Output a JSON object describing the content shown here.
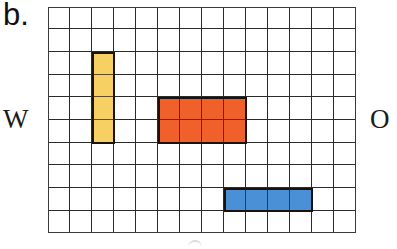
{
  "figure": {
    "panel_label": "b.",
    "labels": {
      "west": "W",
      "east": "O"
    },
    "grid": {
      "columns": 14,
      "rows": 10,
      "line_color": "#2b2b2b",
      "background": "#ffffff"
    },
    "blocks": [
      {
        "name": "yellow-block",
        "color": "#f7d063",
        "col": 2,
        "row": 2,
        "width": 1,
        "height": 4
      },
      {
        "name": "orange-block",
        "color": "#f0602a",
        "col": 5,
        "row": 4,
        "width": 4,
        "height": 2
      },
      {
        "name": "blue-block",
        "color": "#4a90d6",
        "col": 8,
        "row": 8,
        "width": 4,
        "height": 1
      }
    ]
  }
}
